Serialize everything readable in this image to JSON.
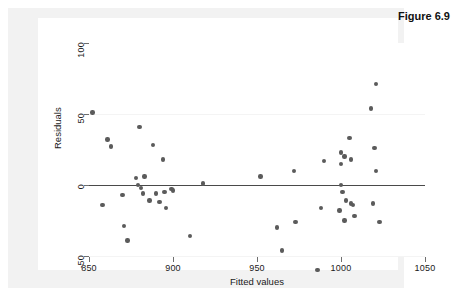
{
  "figure": {
    "caption": "Figure 6.9"
  },
  "chart_data": {
    "type": "scatter",
    "title": "",
    "xlabel": "Fitted values",
    "ylabel": "Residuals",
    "xlim": [
      850,
      1050
    ],
    "ylim": [
      -50,
      100
    ],
    "xticks": [
      850,
      900,
      950,
      1000,
      1050
    ],
    "yticks": [
      -50,
      0,
      50,
      100
    ],
    "grid": true,
    "gridlines_y": [
      50,
      -50
    ],
    "reference_line": {
      "axis": "y",
      "value": 0,
      "color": "#4a4a4a"
    },
    "legend": null,
    "marker_color": "#5b5b5b",
    "points": [
      {
        "x": 852,
        "y": 51
      },
      {
        "x": 858,
        "y": -14
      },
      {
        "x": 861,
        "y": 32
      },
      {
        "x": 863,
        "y": 27
      },
      {
        "x": 870,
        "y": -7
      },
      {
        "x": 871,
        "y": -29
      },
      {
        "x": 873,
        "y": -39
      },
      {
        "x": 878,
        "y": 5
      },
      {
        "x": 879,
        "y": 0
      },
      {
        "x": 880,
        "y": 41
      },
      {
        "x": 881,
        "y": -2
      },
      {
        "x": 882,
        "y": -6
      },
      {
        "x": 883,
        "y": 6
      },
      {
        "x": 886,
        "y": -11
      },
      {
        "x": 888,
        "y": 28
      },
      {
        "x": 890,
        "y": -6
      },
      {
        "x": 892,
        "y": -12
      },
      {
        "x": 894,
        "y": 18
      },
      {
        "x": 895,
        "y": -5
      },
      {
        "x": 896,
        "y": -16
      },
      {
        "x": 899,
        "y": -3
      },
      {
        "x": 900,
        "y": -4
      },
      {
        "x": 910,
        "y": -36
      },
      {
        "x": 918,
        "y": 1
      },
      {
        "x": 952,
        "y": 6
      },
      {
        "x": 962,
        "y": -30
      },
      {
        "x": 965,
        "y": -46
      },
      {
        "x": 972,
        "y": 10
      },
      {
        "x": 973,
        "y": -26
      },
      {
        "x": 986,
        "y": -60
      },
      {
        "x": 988,
        "y": -16
      },
      {
        "x": 990,
        "y": 17
      },
      {
        "x": 999,
        "y": -18
      },
      {
        "x": 1000,
        "y": 23
      },
      {
        "x": 1000,
        "y": 15
      },
      {
        "x": 1000,
        "y": 0
      },
      {
        "x": 1001,
        "y": -5
      },
      {
        "x": 1002,
        "y": 20
      },
      {
        "x": 1002,
        "y": -25
      },
      {
        "x": 1003,
        "y": -11
      },
      {
        "x": 1005,
        "y": 33
      },
      {
        "x": 1006,
        "y": 18
      },
      {
        "x": 1006,
        "y": -13
      },
      {
        "x": 1007,
        "y": -14
      },
      {
        "x": 1008,
        "y": -22
      },
      {
        "x": 1018,
        "y": 54
      },
      {
        "x": 1019,
        "y": -13
      },
      {
        "x": 1020,
        "y": 26
      },
      {
        "x": 1021,
        "y": 71
      },
      {
        "x": 1021,
        "y": 10
      },
      {
        "x": 1023,
        "y": -26
      }
    ]
  }
}
